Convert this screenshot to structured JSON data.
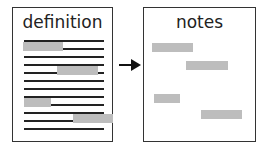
{
  "diagram": {
    "source_doc": {
      "title": "definition",
      "line_count": 12
    },
    "target_doc": {
      "title": "notes"
    },
    "arrow": {
      "icon": "right-arrow-icon",
      "direction": "right"
    },
    "colors": {
      "line": "#222222",
      "highlight": "#bdbdbd",
      "border": "#333333"
    }
  }
}
